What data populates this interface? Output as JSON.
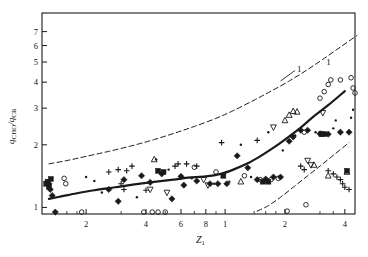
{
  "chart_data": {
    "type": "scatter",
    "title": "",
    "subtitle": "",
    "xlabel": "Z_1",
    "xlabel_base": "Z",
    "xlabel_sub": "1",
    "ylabel": "q_CHO/q_CR",
    "ylabel_num_base": "q",
    "ylabel_num_sub": "CHO",
    "ylabel_den_base": "q",
    "ylabel_den_sub": "CR",
    "xscale": "log",
    "yscale": "log",
    "xlim": [
      1.2,
      45
    ],
    "ylim": [
      0.93,
      8.6
    ],
    "grid": false,
    "legend": "none",
    "xticks": [
      2,
      4,
      6,
      8,
      10,
      20,
      40
    ],
    "xticklabels": [
      "2",
      "4",
      "6",
      "8",
      "1",
      "2",
      "4"
    ],
    "xtick_labels_full": [
      "2",
      "4",
      "6",
      "8",
      "10",
      "20",
      "40"
    ],
    "yticks": [
      1,
      2,
      3,
      4,
      5,
      6,
      7
    ],
    "yticklabels": [
      "1",
      "2",
      "3",
      "4",
      "5",
      "6",
      "7"
    ],
    "xminorticks": [
      1.4,
      1.6,
      1.8,
      3,
      5,
      7,
      9,
      14,
      16,
      18,
      30,
      35
    ],
    "annotations": [
      {
        "text": "1",
        "x": 23.5,
        "y": 4.55,
        "leader": true,
        "target_x": 19.0,
        "target_y": 4.05
      },
      {
        "text": "1",
        "x": 33.0,
        "y": 4.9,
        "leader": false,
        "target_x": null,
        "target_y": null
      }
    ],
    "curves": [
      {
        "name": "central-correlation",
        "label": "1",
        "style": "solid",
        "linewidth": 2.2,
        "points": [
          [
            1.3,
            1.1
          ],
          [
            1.5,
            1.13
          ],
          [
            1.8,
            1.17
          ],
          [
            2.2,
            1.21
          ],
          [
            2.8,
            1.25
          ],
          [
            3.5,
            1.29
          ],
          [
            4.5,
            1.33
          ],
          [
            5.5,
            1.36
          ],
          [
            6.5,
            1.39
          ],
          [
            8.0,
            1.41
          ],
          [
            9.5,
            1.45
          ],
          [
            11.0,
            1.52
          ],
          [
            13.0,
            1.63
          ],
          [
            15.0,
            1.76
          ],
          [
            17.0,
            1.9
          ],
          [
            20.0,
            2.12
          ],
          [
            24.0,
            2.42
          ],
          [
            28.0,
            2.75
          ],
          [
            33.0,
            3.1
          ],
          [
            40.0,
            3.62
          ],
          [
            50.0,
            4.25
          ],
          [
            60.0,
            4.9
          ],
          [
            70.0,
            5.55
          ],
          [
            85.0,
            6.4
          ],
          [
            100.0,
            7.1
          ],
          [
            120.0,
            7.85
          ]
        ]
      },
      {
        "name": "upper-bound",
        "style": "dashed",
        "linewidth": 1.0,
        "points": [
          [
            1.3,
            1.62
          ],
          [
            1.6,
            1.68
          ],
          [
            2.0,
            1.76
          ],
          [
            2.6,
            1.86
          ],
          [
            3.4,
            1.98
          ],
          [
            4.4,
            2.12
          ],
          [
            5.6,
            2.28
          ],
          [
            7.0,
            2.45
          ],
          [
            9.0,
            2.68
          ],
          [
            11.0,
            2.92
          ],
          [
            14.0,
            3.28
          ],
          [
            17.0,
            3.62
          ],
          [
            21.0,
            4.05
          ],
          [
            26.0,
            4.6
          ],
          [
            31.0,
            5.15
          ],
          [
            38.0,
            5.9
          ],
          [
            46.0,
            6.7
          ],
          [
            55.0,
            7.55
          ],
          [
            63.0,
            8.2
          ]
        ]
      },
      {
        "name": "lower-bound",
        "style": "dashed",
        "linewidth": 1.0,
        "points": [
          [
            14.5,
            0.96
          ],
          [
            16.5,
            1.02
          ],
          [
            19.0,
            1.12
          ],
          [
            22.0,
            1.25
          ],
          [
            26.0,
            1.42
          ],
          [
            30.0,
            1.58
          ],
          [
            35.0,
            1.78
          ],
          [
            42.0,
            2.05
          ],
          [
            50.0,
            2.35
          ],
          [
            60.0,
            2.72
          ],
          [
            72.0,
            3.15
          ],
          [
            85.0,
            3.6
          ],
          [
            100.0,
            4.1
          ],
          [
            115.0,
            4.6
          ],
          [
            130.0,
            5.05
          ],
          [
            145.0,
            5.45
          ]
        ]
      }
    ],
    "series": [
      {
        "name": "filled-diamond",
        "marker": "filled-diamond",
        "points": [
          [
            1.3,
            1.3
          ],
          [
            1.32,
            1.22
          ],
          [
            1.35,
            1.14
          ],
          [
            1.4,
            0.95
          ],
          [
            2.6,
            1.22
          ],
          [
            2.9,
            1.07
          ],
          [
            4.2,
            1.32
          ],
          [
            5.4,
            1.1
          ],
          [
            6.0,
            1.41
          ],
          [
            6.2,
            1.28
          ],
          [
            7.2,
            1.34
          ],
          [
            8.4,
            1.3
          ],
          [
            9.2,
            1.3
          ],
          [
            10.2,
            1.3
          ],
          [
            11.5,
            1.77
          ],
          [
            14.5,
            1.36
          ],
          [
            16.0,
            1.37
          ],
          [
            17.5,
            1.4
          ],
          [
            19.0,
            1.4
          ],
          [
            21.0,
            2.08
          ],
          [
            22.0,
            2.18
          ],
          [
            24.0,
            2.35
          ],
          [
            26.0,
            2.35
          ],
          [
            30.0,
            2.26
          ],
          [
            33.0,
            2.25
          ],
          [
            38.0,
            2.3
          ],
          [
            42.0,
            2.3
          ],
          [
            47.0,
            2.42
          ],
          [
            53.0,
            3.38
          ],
          [
            57.0,
            3.35
          ],
          [
            60.0,
            4.05
          ],
          [
            63.0,
            4.02
          ],
          [
            66.0,
            2.9
          ],
          [
            72.0,
            4.0
          ],
          [
            82.0,
            7.8
          ],
          [
            92.0,
            7.2
          ],
          [
            4.8,
            1.45
          ],
          [
            3.8,
            1.42
          ],
          [
            3.1,
            1.36
          ],
          [
            13.0,
            1.55
          ]
        ]
      },
      {
        "name": "filled-square",
        "marker": "filled-square",
        "points": [
          [
            1.28,
            1.33
          ],
          [
            1.3,
            1.26
          ],
          [
            1.33,
            1.37
          ],
          [
            4.6,
            1.5
          ],
          [
            4.9,
            1.48
          ],
          [
            9.8,
            1.42
          ],
          [
            15.5,
            1.33
          ],
          [
            16.5,
            1.33
          ],
          [
            30.5,
            2.25
          ],
          [
            31.5,
            2.25
          ],
          [
            41.0,
            1.5
          ],
          [
            61.0,
            5.45
          ],
          [
            62.0,
            5.25
          ],
          [
            63.5,
            5.3
          ],
          [
            1.26,
            1.3
          ]
        ]
      },
      {
        "name": "open-circle",
        "marker": "open-circle",
        "points": [
          [
            1.55,
            1.38
          ],
          [
            1.58,
            1.3
          ],
          [
            1.9,
            0.95
          ],
          [
            3.9,
            0.95
          ],
          [
            4.3,
            0.95
          ],
          [
            4.6,
            0.95
          ],
          [
            5.0,
            0.95
          ],
          [
            7.0,
            1.56
          ],
          [
            9.0,
            1.48
          ],
          [
            12.5,
            1.42
          ],
          [
            15.0,
            1.36
          ],
          [
            17.0,
            1.36
          ],
          [
            18.5,
            1.38
          ],
          [
            25.0,
            2.3
          ],
          [
            30.0,
            3.35
          ],
          [
            31.5,
            3.6
          ],
          [
            33.0,
            3.9
          ],
          [
            34.0,
            4.1
          ],
          [
            38.0,
            4.1
          ],
          [
            43.0,
            4.2
          ],
          [
            48.0,
            5.0
          ],
          [
            49.0,
            5.2
          ],
          [
            52.0,
            4.0
          ],
          [
            57.0,
            4.0
          ],
          [
            66.0,
            3.5
          ],
          [
            70.0,
            3.2
          ],
          [
            76.0,
            6.45
          ],
          [
            78.0,
            6.2
          ],
          [
            88.0,
            7.95
          ],
          [
            100.0,
            7.9
          ],
          [
            108.0,
            7.95
          ],
          [
            25.5,
            1.03
          ],
          [
            20.5,
            0.96
          ],
          [
            44.0,
            3.75
          ],
          [
            45.0,
            3.55
          ]
        ]
      },
      {
        "name": "open-triangle-up",
        "marker": "open-triangle-up",
        "points": [
          [
            4.4,
            1.7
          ],
          [
            12.0,
            1.33
          ],
          [
            20.0,
            2.62
          ],
          [
            21.0,
            2.78
          ],
          [
            22.0,
            2.9
          ],
          [
            23.0,
            2.88
          ],
          [
            28.0,
            1.6
          ],
          [
            48.0,
            3.35
          ],
          [
            57.0,
            5.1
          ],
          [
            62.0,
            6.2
          ],
          [
            68.0,
            3.05
          ],
          [
            72.0,
            3.08
          ],
          [
            33.0,
            1.42
          ],
          [
            41.0,
            1.48
          ]
        ]
      },
      {
        "name": "open-triangle-down",
        "marker": "open-triangle-down",
        "points": [
          [
            7.8,
            1.36
          ],
          [
            8.2,
            1.28
          ],
          [
            17.5,
            2.43
          ],
          [
            26.0,
            1.68
          ],
          [
            27.0,
            1.6
          ],
          [
            31.0,
            2.85
          ],
          [
            49.0,
            4.3
          ],
          [
            55.0,
            4.15
          ],
          [
            74.0,
            7.35
          ],
          [
            82.0,
            7.6
          ],
          [
            96.0,
            7.85
          ],
          [
            4.2,
            1.22
          ],
          [
            5.1,
            1.18
          ]
        ]
      },
      {
        "name": "plus-cross",
        "marker": "plus",
        "points": [
          [
            2.9,
            1.52
          ],
          [
            3.2,
            1.5
          ],
          [
            3.4,
            1.58
          ],
          [
            5.6,
            1.58
          ],
          [
            6.4,
            1.62
          ],
          [
            7.2,
            1.58
          ],
          [
            2.6,
            1.48
          ],
          [
            3.0,
            1.3
          ],
          [
            3.1,
            1.22
          ],
          [
            4.0,
            1.21
          ],
          [
            5.8,
            1.62
          ],
          [
            33.0,
            1.5
          ],
          [
            35.0,
            1.45
          ],
          [
            36.5,
            1.4
          ],
          [
            38.0,
            1.36
          ],
          [
            39.0,
            1.3
          ],
          [
            40.0,
            1.25
          ],
          [
            42.0,
            1.22
          ],
          [
            9.6,
            2.05
          ],
          [
            14.5,
            2.1
          ],
          [
            55.0,
            2.05
          ],
          [
            56.0,
            2.12
          ],
          [
            24.0,
            1.58
          ],
          [
            25.0,
            1.52
          ]
        ]
      },
      {
        "name": "small-dot",
        "marker": "dot",
        "points": [
          [
            2.4,
            1.18
          ],
          [
            3.6,
            1.12
          ],
          [
            4.5,
            1.7
          ],
          [
            5.2,
            1.52
          ],
          [
            6.8,
            1.38
          ],
          [
            8.8,
            1.3
          ],
          [
            10.5,
            1.33
          ],
          [
            13.5,
            1.4
          ],
          [
            19.5,
            1.88
          ],
          [
            22.5,
            2.22
          ],
          [
            28.5,
            2.3
          ],
          [
            35.0,
            2.4
          ],
          [
            43.0,
            2.7
          ],
          [
            51.0,
            2.95
          ],
          [
            58.0,
            3.35
          ],
          [
            64.0,
            5.55
          ],
          [
            70.0,
            5.9
          ],
          [
            2.0,
            1.4
          ],
          [
            2.2,
            1.34
          ],
          [
            12.0,
            2.0
          ],
          [
            16.5,
            2.3
          ],
          [
            44.0,
            2.95
          ],
          [
            36.0,
            2.62
          ]
        ]
      }
    ]
  }
}
